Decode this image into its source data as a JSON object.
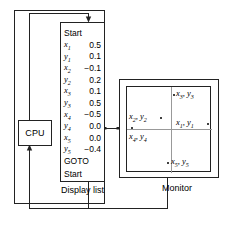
{
  "diagram": {
    "cpu": {
      "label": "CPU"
    },
    "display_list": {
      "caption": "Display list",
      "header": "Start",
      "footer_goto": "GOTO",
      "footer_target": "Start",
      "entries": [
        {
          "var": "x",
          "index": "1",
          "value": "0.5"
        },
        {
          "var": "y",
          "index": "1",
          "value": "0.1"
        },
        {
          "var": "x",
          "index": "2",
          "value": "−0.1"
        },
        {
          "var": "y",
          "index": "2",
          "value": "0.2"
        },
        {
          "var": "x",
          "index": "3",
          "value": "0.1"
        },
        {
          "var": "y",
          "index": "3",
          "value": "0.5"
        },
        {
          "var": "x",
          "index": "4",
          "value": "−0.5"
        },
        {
          "var": "y",
          "index": "4",
          "value": "0.0"
        },
        {
          "var": "x",
          "index": "5",
          "value": "0.0"
        },
        {
          "var": "y",
          "index": "5",
          "value": "−0.4"
        }
      ]
    },
    "monitor": {
      "caption": "Monitor",
      "points": [
        {
          "id": "p1",
          "label_x": "x",
          "label_y": "y",
          "index": "1",
          "dot_side": "right",
          "dot_x": 80,
          "dot_y": 36,
          "text_x": 49,
          "text_y": 30
        },
        {
          "id": "p2",
          "label_x": "x",
          "label_y": "y",
          "index": "2",
          "dot_side": "right",
          "dot_x": 33,
          "dot_y": 30,
          "text_x": 2,
          "text_y": 24
        },
        {
          "id": "p3",
          "label_x": "x",
          "label_y": "y",
          "index": "3",
          "dot_side": "left",
          "dot_x": 46,
          "dot_y": 7,
          "text_x": 49,
          "text_y": 1
        },
        {
          "id": "p4",
          "label_x": "x",
          "label_y": "y",
          "index": "4",
          "dot_side": "above",
          "dot_x": 4,
          "dot_y": 40,
          "text_x": 2,
          "text_y": 44
        },
        {
          "id": "p5",
          "label_x": "x",
          "label_y": "y",
          "index": "5",
          "dot_side": "left",
          "dot_x": 40,
          "dot_y": 75,
          "text_x": 44,
          "text_y": 69
        }
      ]
    },
    "colors": {
      "line": "#222222",
      "axis": "#999999",
      "background": "#ffffff"
    }
  }
}
